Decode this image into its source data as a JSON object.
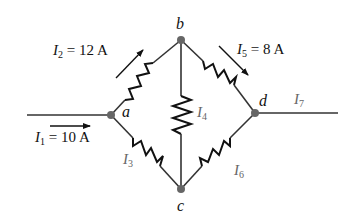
{
  "diagram": {
    "type": "resistor-bridge-circuit",
    "colors": {
      "wire": "#333333",
      "resistor": "#111111",
      "node": "#666666",
      "label": "#111111",
      "label_gray": "#666666"
    },
    "nodes": [
      {
        "id": "a",
        "label": "a"
      },
      {
        "id": "b",
        "label": "b"
      },
      {
        "id": "c",
        "label": "c"
      },
      {
        "id": "d",
        "label": "d"
      }
    ],
    "currents": {
      "I1": {
        "symbol": "I",
        "sub": "1",
        "value": "= 10 A"
      },
      "I2": {
        "symbol": "I",
        "sub": "2",
        "value": "= 12 A"
      },
      "I3": {
        "symbol": "I",
        "sub": "3",
        "value": ""
      },
      "I4": {
        "symbol": "I",
        "sub": "4",
        "value": ""
      },
      "I5": {
        "symbol": "I",
        "sub": "5",
        "value": "= 8 A"
      },
      "I6": {
        "symbol": "I",
        "sub": "6",
        "value": ""
      },
      "I7": {
        "symbol": "I",
        "sub": "7",
        "value": ""
      }
    },
    "branches": [
      {
        "from": "a",
        "to": "b",
        "current": "I2"
      },
      {
        "from": "a",
        "to": "c",
        "current": "I3"
      },
      {
        "from": "b",
        "to": "c",
        "current": "I4"
      },
      {
        "from": "b",
        "to": "d",
        "current": "I5"
      },
      {
        "from": "c",
        "to": "d",
        "current": "I6"
      }
    ]
  }
}
